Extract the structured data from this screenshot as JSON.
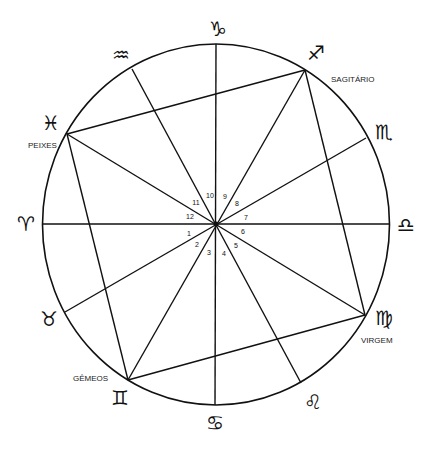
{
  "diagram": {
    "type": "astrological-chart",
    "center": [
      216,
      224
    ],
    "radius_x": 173,
    "radius_y": 180,
    "signs": [
      {
        "key": "aries",
        "glyph": "♈",
        "label": "",
        "point": [
          42,
          224
        ],
        "glyph_pos": [
          26,
          231
        ]
      },
      {
        "key": "taurus",
        "glyph": "♉",
        "label": "",
        "point": [
          65,
          312
        ],
        "glyph_pos": [
          49,
          326
        ]
      },
      {
        "key": "gemini",
        "glyph": "♊",
        "label": "GÊMEOS",
        "point": [
          128,
          380
        ],
        "glyph_pos": [
          120,
          405
        ],
        "label_pos": [
          73,
          381
        ]
      },
      {
        "key": "cancer",
        "glyph": "♋",
        "label": "",
        "point": [
          215,
          405
        ],
        "glyph_pos": [
          215,
          430
        ]
      },
      {
        "key": "leo",
        "glyph": "♌",
        "label": "",
        "point": [
          301,
          383
        ],
        "glyph_pos": [
          313,
          409
        ]
      },
      {
        "key": "virgo",
        "glyph": "♍",
        "label": "VIRGEM",
        "point": [
          365,
          315
        ],
        "glyph_pos": [
          384,
          325
        ],
        "label_pos": [
          361,
          343
        ]
      },
      {
        "key": "libra",
        "glyph": "♎",
        "label": "",
        "point": [
          389,
          224
        ],
        "glyph_pos": [
          406,
          232
        ]
      },
      {
        "key": "scorpio",
        "glyph": "♏",
        "label": "",
        "point": [
          366,
          138
        ],
        "glyph_pos": [
          384,
          139
        ]
      },
      {
        "key": "sagittarius",
        "glyph": "♐",
        "label": "SAGITÁRIO",
        "point": [
          305,
          70
        ],
        "glyph_pos": [
          316,
          60
        ],
        "label_pos": [
          331,
          82
        ]
      },
      {
        "key": "capricorn",
        "glyph": "♑",
        "label": "",
        "point": [
          216,
          44
        ],
        "glyph_pos": [
          218,
          36
        ]
      },
      {
        "key": "aquarius",
        "glyph": "♒",
        "label": "",
        "point": [
          132,
          69
        ],
        "glyph_pos": [
          121,
          62
        ]
      },
      {
        "key": "pisces",
        "glyph": "♓",
        "label": "PEIXES",
        "point": [
          67,
          134
        ],
        "glyph_pos": [
          51,
          130
        ],
        "label_pos": [
          28,
          148
        ]
      }
    ],
    "house_numbers": [
      {
        "n": "1",
        "pos": [
          189,
          236
        ]
      },
      {
        "n": "2",
        "pos": [
          197,
          247
        ]
      },
      {
        "n": "3",
        "pos": [
          209,
          255
        ]
      },
      {
        "n": "4",
        "pos": [
          224,
          256
        ]
      },
      {
        "n": "5",
        "pos": [
          236,
          248
        ]
      },
      {
        "n": "6",
        "pos": [
          243,
          234
        ]
      },
      {
        "n": "7",
        "pos": [
          246,
          220
        ]
      },
      {
        "n": "8",
        "pos": [
          237,
          206
        ]
      },
      {
        "n": "9",
        "pos": [
          225,
          199
        ]
      },
      {
        "n": "10",
        "pos": [
          210,
          198
        ]
      },
      {
        "n": "11",
        "pos": [
          196,
          205
        ]
      },
      {
        "n": "12",
        "pos": [
          190,
          219
        ]
      }
    ],
    "diameters": [
      [
        "aries",
        "libra"
      ],
      [
        "capricorn",
        "cancer"
      ],
      [
        "pisces",
        "virgo"
      ],
      [
        "sagittarius",
        "gemini"
      ],
      [
        "aquarius",
        "leo"
      ],
      [
        "scorpio",
        "taurus"
      ]
    ],
    "square_sides": [
      [
        "pisces",
        "sagittarius"
      ],
      [
        "sagittarius",
        "virgo"
      ],
      [
        "virgo",
        "gemini"
      ],
      [
        "gemini",
        "pisces"
      ]
    ]
  }
}
